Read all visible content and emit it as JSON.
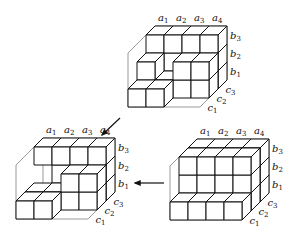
{
  "figures": [
    {
      "id": "top",
      "a_labels": [
        "a1",
        "a2",
        "a3",
        "a4"
      ],
      "b_labels": [
        "b3",
        "b2",
        "b1"
      ],
      "c_labels": [
        "c3",
        "c2",
        "c1"
      ],
      "origin": [
        128,
        107
      ],
      "cubes": [
        [
          0,
          0,
          0
        ],
        [
          1,
          0,
          0
        ],
        [
          1,
          0,
          1
        ],
        [
          2,
          0,
          1
        ],
        [
          2,
          1,
          1
        ],
        [
          3,
          0,
          1
        ],
        [
          3,
          1,
          1
        ],
        [
          0,
          1,
          1
        ],
        [
          1,
          0,
          2
        ],
        [
          1,
          1,
          2
        ],
        [
          1,
          2,
          2
        ],
        [
          0,
          1,
          2
        ],
        [
          0,
          2,
          2
        ],
        [
          3,
          0,
          2
        ],
        [
          3,
          1,
          2
        ],
        [
          3,
          2,
          2
        ],
        [
          2,
          2,
          2
        ]
      ]
    },
    {
      "id": "bottom-left",
      "a_labels": [
        "a1",
        "a2",
        "a3",
        "a4"
      ],
      "b_labels": [
        "b3",
        "b2",
        "b1"
      ],
      "c_labels": [
        "c3",
        "c2",
        "c1"
      ],
      "origin": [
        16,
        219
      ],
      "cubes": [
        [
          0,
          0,
          0
        ],
        [
          1,
          0,
          0
        ],
        [
          0,
          0,
          1
        ],
        [
          1,
          0,
          1
        ],
        [
          2,
          0,
          1
        ],
        [
          3,
          0,
          1
        ],
        [
          2,
          1,
          1
        ],
        [
          3,
          1,
          1
        ],
        [
          1,
          1,
          2
        ],
        [
          1,
          2,
          2
        ],
        [
          0,
          2,
          2
        ],
        [
          3,
          0,
          2
        ],
        [
          3,
          1,
          2
        ],
        [
          3,
          2,
          2
        ],
        [
          2,
          2,
          2
        ],
        [
          2,
          1,
          2
        ]
      ]
    },
    {
      "id": "bottom-right",
      "a_labels": [
        "a1",
        "a2",
        "a3",
        "a4"
      ],
      "b_labels": [
        "b3",
        "b2",
        "b1"
      ],
      "c_labels": [
        "c3",
        "c2",
        "c1"
      ],
      "origin": [
        170,
        220
      ],
      "cubes": [
        [
          0,
          0,
          0
        ],
        [
          1,
          0,
          0
        ],
        [
          2,
          0,
          0
        ],
        [
          3,
          0,
          0
        ],
        [
          0,
          0,
          1
        ],
        [
          1,
          0,
          1
        ],
        [
          2,
          0,
          1
        ],
        [
          3,
          0,
          1
        ],
        [
          0,
          1,
          1
        ],
        [
          1,
          1,
          1
        ],
        [
          2,
          1,
          1
        ],
        [
          3,
          1,
          1
        ],
        [
          0,
          2,
          1
        ],
        [
          1,
          2,
          1
        ],
        [
          2,
          2,
          1
        ],
        [
          3,
          2,
          1
        ],
        [
          0,
          0,
          2
        ],
        [
          1,
          0,
          2
        ],
        [
          2,
          0,
          2
        ],
        [
          3,
          0,
          2
        ],
        [
          0,
          1,
          2
        ],
        [
          1,
          1,
          2
        ],
        [
          2,
          1,
          2
        ],
        [
          3,
          1,
          2
        ],
        [
          0,
          2,
          2
        ],
        [
          1,
          2,
          2
        ],
        [
          2,
          2,
          2
        ],
        [
          3,
          2,
          2
        ]
      ]
    }
  ],
  "arrows": [
    {
      "id": "top-to-bottom-left",
      "from": [
        120,
        118
      ],
      "to": [
        102,
        135
      ]
    },
    {
      "id": "bottom-right-to-bottom-left",
      "from": [
        164,
        183
      ],
      "to": [
        135,
        183
      ]
    }
  ]
}
